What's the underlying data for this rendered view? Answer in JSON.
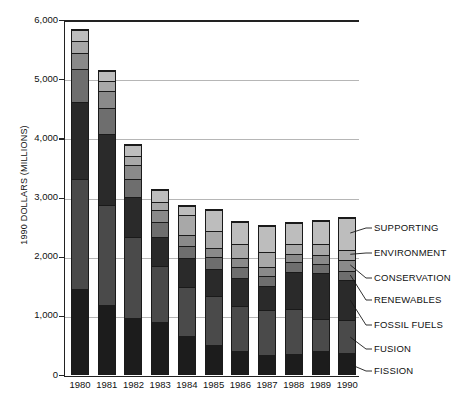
{
  "chart_data": {
    "type": "bar",
    "subtype": "stacked-bar",
    "title": "",
    "xlabel": "",
    "ylabel": "1990 DOLLARS (MILLIONS)",
    "ylim": [
      0,
      6000
    ],
    "ytick_labels": [
      "0",
      "1,000",
      "2,000",
      "3,000",
      "4,000",
      "5,000",
      "6,000"
    ],
    "ytick_values": [
      0,
      1000,
      2000,
      3000,
      4000,
      5000,
      6000
    ],
    "grid": true,
    "grid_axis": "y",
    "legend_position": "right-callout",
    "categories": [
      "1980",
      "1981",
      "1982",
      "1983",
      "1984",
      "1985",
      "1986",
      "1987",
      "1988",
      "1989",
      "1990"
    ],
    "series": [
      {
        "name": "FISSION",
        "color": "#1c1c1c",
        "values": [
          1440,
          1180,
          960,
          890,
          650,
          500,
          390,
          330,
          350,
          390,
          360
        ]
      },
      {
        "name": "FUSION",
        "color": "#4a4a4a",
        "values": [
          1870,
          1700,
          1380,
          960,
          830,
          830,
          780,
          760,
          760,
          560,
          560
        ]
      },
      {
        "name": "FOSSIL FUELS",
        "color": "#2a2a2a",
        "values": [
          1320,
          1200,
          680,
          490,
          500,
          470,
          470,
          410,
          640,
          780,
          690
        ]
      },
      {
        "name": "RENEWABLES",
        "color": "#6e6e6e",
        "values": [
          560,
          440,
          300,
          250,
          210,
          200,
          190,
          180,
          160,
          160,
          160
        ]
      },
      {
        "name": "CONSERVATION",
        "color": "#8a8a8a",
        "values": [
          270,
          290,
          240,
          210,
          180,
          160,
          150,
          150,
          140,
          150,
          180
        ]
      },
      {
        "name": "ENVIRONMENT",
        "color": "#a8a8a8",
        "values": [
          200,
          180,
          150,
          140,
          350,
          280,
          250,
          260,
          170,
          190,
          180
        ]
      },
      {
        "name": "SUPPORTING",
        "color": "#bdbdbd",
        "values": [
          180,
          170,
          190,
          210,
          160,
          360,
          370,
          450,
          360,
          390,
          540
        ]
      }
    ],
    "totals": [
      5840,
      5160,
      3900,
      3150,
      2880,
      2800,
      2600,
      2540,
      2580,
      2620,
      2670
    ]
  },
  "legend": {
    "entries": [
      {
        "label": "SUPPORTING"
      },
      {
        "label": "ENVIRONMENT"
      },
      {
        "label": "CONSERVATION"
      },
      {
        "label": "RENEWABLES"
      },
      {
        "label": "FOSSIL FUELS"
      },
      {
        "label": "FUSION"
      },
      {
        "label": "FISSION"
      }
    ]
  }
}
